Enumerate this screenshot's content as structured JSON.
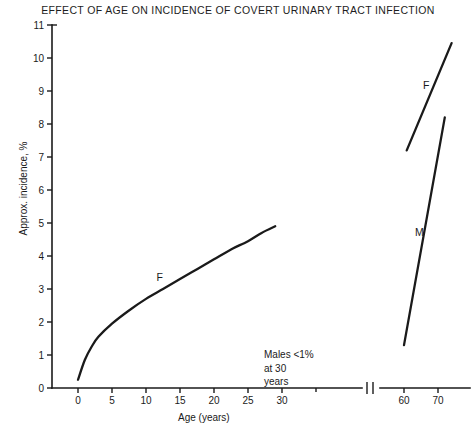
{
  "chart_data": {
    "type": "line",
    "title": "EFFECT OF AGE ON INCIDENCE OF COVERT URINARY TRACT INFECTION",
    "xlabel": "Age (years)",
    "ylabel": "Approx. incidence, %",
    "ylim": [
      0,
      11
    ],
    "yticks": [
      0,
      1,
      2,
      3,
      4,
      5,
      6,
      7,
      8,
      9,
      10,
      11
    ],
    "grid": false,
    "legend_position": "inline-labels",
    "axis_break": true,
    "axis_break_note": "x-axis is broken between 30 and 60 years",
    "x_segments": [
      {
        "name": "childhood-young-adult",
        "ticks": [
          0,
          5,
          10,
          15,
          20,
          25,
          30
        ]
      },
      {
        "name": "elderly",
        "ticks": [
          60,
          70
        ]
      }
    ],
    "annotations": [
      {
        "name": "males-note",
        "text": "Males <1%\nat 30\nyears",
        "x": 40,
        "y": 1.2
      }
    ],
    "series": [
      {
        "name": "F",
        "label": "F",
        "description": "Females, childhood to young adulthood",
        "segment": "childhood-young-adult",
        "points": [
          {
            "x": 0,
            "y": 0.25
          },
          {
            "x": 1,
            "y": 0.85
          },
          {
            "x": 2,
            "y": 1.25
          },
          {
            "x": 3,
            "y": 1.55
          },
          {
            "x": 5,
            "y": 1.95
          },
          {
            "x": 7.5,
            "y": 2.35
          },
          {
            "x": 10,
            "y": 2.7
          },
          {
            "x": 12.5,
            "y": 3.0
          },
          {
            "x": 15,
            "y": 3.3
          },
          {
            "x": 17.5,
            "y": 3.6
          },
          {
            "x": 20,
            "y": 3.9
          },
          {
            "x": 22.5,
            "y": 4.2
          },
          {
            "x": 25,
            "y": 4.45
          },
          {
            "x": 27,
            "y": 4.7
          },
          {
            "x": 29,
            "y": 4.9
          }
        ],
        "label_at": {
          "x": 12.0,
          "y": 3.25
        }
      },
      {
        "name": "F-elderly",
        "label": "F",
        "description": "Females, elderly",
        "segment": "elderly",
        "points": [
          {
            "x": 60.8,
            "y": 7.2
          },
          {
            "x": 74.0,
            "y": 10.45
          }
        ],
        "label_at": {
          "x": 66.5,
          "y": 9.05
        }
      },
      {
        "name": "M-elderly",
        "label": "M",
        "description": "Males, elderly",
        "segment": "elderly",
        "points": [
          {
            "x": 60.0,
            "y": 1.3
          },
          {
            "x": 72.0,
            "y": 8.2
          }
        ],
        "label_at": {
          "x": 64.5,
          "y": 4.6
        }
      }
    ]
  }
}
